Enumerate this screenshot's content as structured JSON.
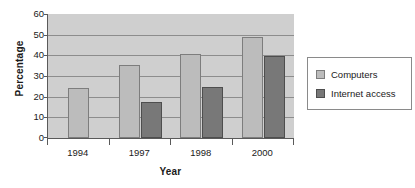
{
  "chart_data": {
    "type": "bar",
    "title": "",
    "xlabel": "Year",
    "ylabel": "Percentage",
    "categories": [
      "1994",
      "1997",
      "1998",
      "2000"
    ],
    "series": [
      {
        "name": "Computers",
        "color": "#bcbcbc",
        "values": [
          24,
          35.5,
          40.5,
          49
        ]
      },
      {
        "name": "Internet access",
        "color": "#787878",
        "values": [
          null,
          17.5,
          24.5,
          39.5
        ]
      }
    ],
    "ylim": [
      0,
      60
    ],
    "ytick_step": 10,
    "ytick_labels": [
      "0",
      "10",
      "20",
      "30",
      "40",
      "50",
      "60"
    ],
    "grid": true,
    "legend_position": "right",
    "plot_background": "#cfcfcf",
    "axis_color": "#5a5a5a",
    "gridline_color": "#8d8d8d"
  }
}
